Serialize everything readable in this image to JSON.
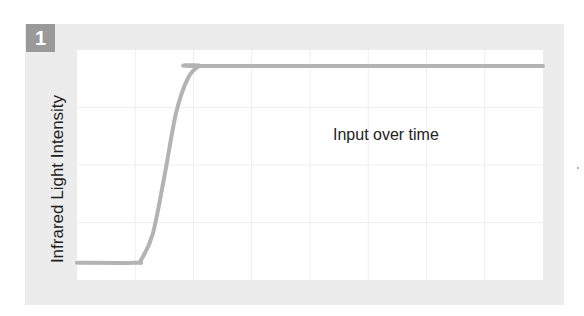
{
  "panel": {
    "number": "1"
  },
  "chart_data": {
    "type": "line",
    "title": "",
    "annotation": "Input over time",
    "xlabel": "",
    "ylabel": "Infrared Light Intensity",
    "grid": true,
    "grid_columns": 8,
    "grid_rows": 4,
    "xlim": [
      0,
      8
    ],
    "ylim": [
      0,
      4
    ],
    "series": [
      {
        "name": "Input",
        "color": "#b3b3b3",
        "x": [
          0,
          1.0,
          1.1,
          1.3,
          1.5,
          1.7,
          1.9,
          2.1,
          2.3,
          8
        ],
        "values": [
          0.3,
          0.3,
          0.35,
          0.8,
          1.8,
          2.9,
          3.5,
          3.72,
          3.72,
          3.72
        ]
      }
    ],
    "colors": {
      "frame": "#ececec",
      "badge": "#9a9a9a",
      "gridline": "#eeeeee",
      "line": "#b3b3b3"
    }
  }
}
